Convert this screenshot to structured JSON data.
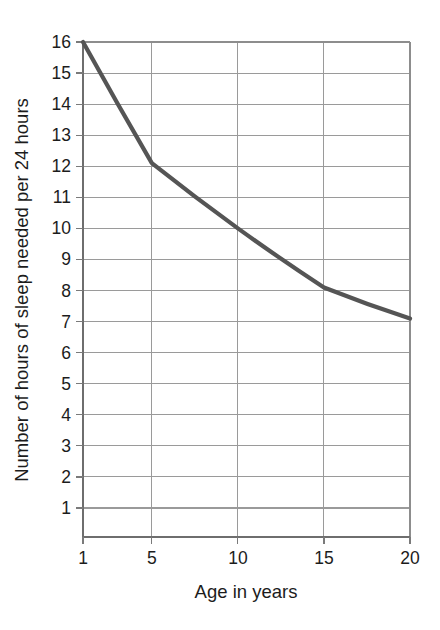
{
  "chart_data": {
    "type": "line",
    "title": "",
    "xlabel": "Age in years",
    "ylabel": "Number of hours of sleep needed per 24 hours",
    "x": [
      1,
      5,
      10,
      15,
      20
    ],
    "values": [
      16,
      12.1,
      10,
      8.1,
      7.1
    ],
    "series": [
      {
        "name": "hours of sleep needed",
        "values": [
          16,
          12.1,
          10,
          8.1,
          7.1
        ]
      }
    ],
    "xlim": [
      1,
      20
    ],
    "ylim": [
      0,
      16
    ],
    "xticks": [
      1,
      5,
      10,
      15,
      20
    ],
    "xtick_labels": [
      "1",
      "5",
      "10",
      "15",
      "20"
    ],
    "yticks": [
      1,
      2,
      3,
      4,
      5,
      6,
      7,
      8,
      9,
      10,
      11,
      12,
      13,
      14,
      15,
      16
    ],
    "ytick_labels": [
      "1",
      "2",
      "3",
      "4",
      "5",
      "6",
      "7",
      "8",
      "9",
      "10",
      "11",
      "12",
      "13",
      "14",
      "15",
      "16"
    ],
    "grid": true,
    "legend": "none",
    "line_color": "#555555",
    "grid_color": "#9a9a9a",
    "axis_color": "#6e6e6e",
    "background_color": "#ffffff"
  }
}
